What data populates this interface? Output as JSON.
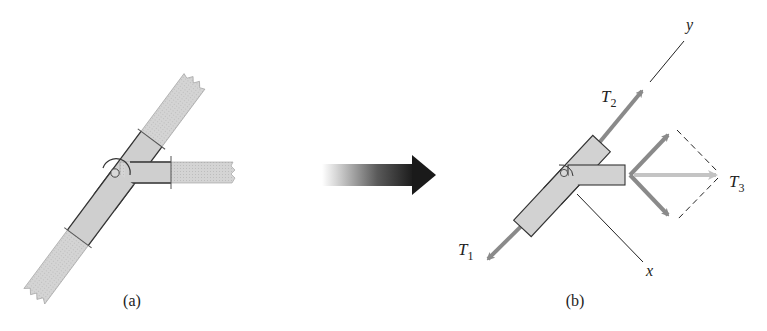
{
  "figure": {
    "panel_a": {
      "caption": "(a)"
    },
    "panel_b": {
      "caption": "(b)",
      "axis_x_label": "x",
      "axis_y_label": "y",
      "forces": [
        {
          "name": "T",
          "subscript": "1"
        },
        {
          "name": "T",
          "subscript": "2"
        },
        {
          "name": "T",
          "subscript": "3"
        }
      ]
    },
    "transition_arrow": {
      "meaning": "free-body-diagram-of-joint"
    }
  },
  "colors": {
    "member_fill": "#d2d2d2",
    "member_band_fill": "#c9c9c9",
    "outline": "#333333",
    "force_arrow": "#8a8a8a",
    "resultant_arrow": "#c4c4c4",
    "transition_arrow_dark": "#1a1a1a"
  }
}
